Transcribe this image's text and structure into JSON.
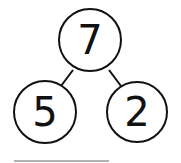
{
  "diagram": {
    "type": "number-bond",
    "whole": "7",
    "parts": [
      "5",
      "2"
    ],
    "colors": {
      "stroke": "#111111",
      "underline": "#9a9a9a",
      "background": "#ffffff"
    }
  }
}
